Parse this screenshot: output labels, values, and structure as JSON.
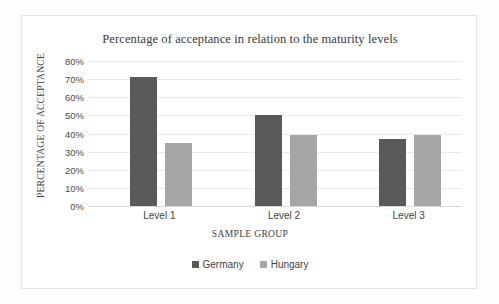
{
  "chart_data": {
    "type": "bar",
    "title": "Percentage of acceptance in relation to the maturity levels",
    "xlabel": "SAMPLE GROUP",
    "ylabel": "PERCENTAGE OF ACCEPTANCE",
    "categories": [
      "Level 1",
      "Level 2",
      "Level 3"
    ],
    "series": [
      {
        "name": "Germany",
        "color": "#595959",
        "values": [
          71,
          50,
          37
        ]
      },
      {
        "name": "Hungary",
        "color": "#a6a6a6",
        "values": [
          35,
          39,
          39
        ]
      }
    ],
    "ylim": [
      0,
      80
    ],
    "ytick_labels": [
      "80%",
      "70%",
      "60%",
      "50%",
      "40%",
      "30%",
      "20%",
      "10%",
      "0%"
    ],
    "ytick_values": [
      80,
      70,
      60,
      50,
      40,
      30,
      20,
      10,
      0
    ],
    "grid": true,
    "legend_position": "bottom"
  }
}
